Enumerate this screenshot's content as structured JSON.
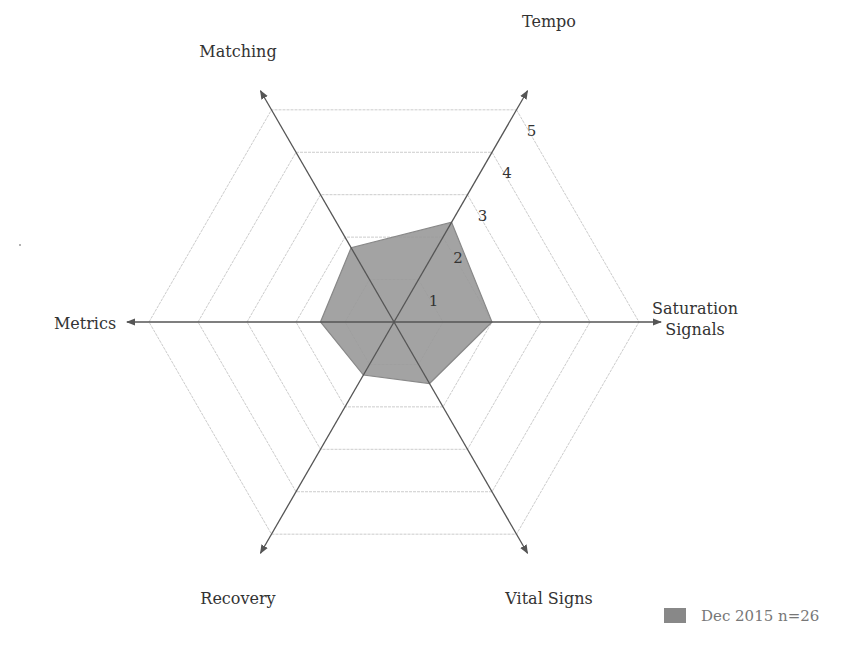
{
  "chart_data": {
    "type": "radar",
    "title": "",
    "axes": [
      "Tempo",
      "Saturation Signals",
      "Vital Signs",
      "Recovery",
      "Metrics",
      "Matching"
    ],
    "axis_label_lines": [
      [
        "Tempo"
      ],
      [
        "Saturation",
        "Signals"
      ],
      [
        "Vital Signs"
      ],
      [
        "Recovery"
      ],
      [
        "Metrics"
      ],
      [
        "Matching"
      ]
    ],
    "series": [
      {
        "name": "Dec 2015 n=26",
        "values": [
          2.35,
          2.0,
          1.45,
          1.25,
          1.5,
          1.75
        ],
        "fill": "#999999",
        "stroke": "#888888"
      }
    ],
    "rlim": [
      0,
      5
    ],
    "ticks": [
      1,
      2,
      3,
      4,
      5
    ],
    "tick_labels": [
      "1",
      "2",
      "3",
      "4",
      "5"
    ],
    "grid": true,
    "legend_position": "bottom-right"
  },
  "layout": {
    "center": [
      394,
      322
    ],
    "level_step": 49,
    "axis_extent": 5.45,
    "axis_color": "#555555",
    "grid_color": "#cccccc",
    "label_positions": [
      [
        549,
        27
      ],
      [
        695,
        314
      ],
      [
        549,
        604
      ],
      [
        238,
        604
      ],
      [
        85,
        329
      ],
      [
        238,
        57
      ]
    ]
  },
  "legend": {
    "label": "Dec 2015 n=26",
    "swatch_color": "#888888"
  }
}
